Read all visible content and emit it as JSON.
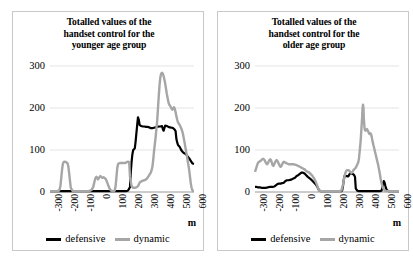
{
  "figure": {
    "unit_label": "m",
    "legend": [
      {
        "name": "defensive-series",
        "label": "defensive",
        "color": "#000000"
      },
      {
        "name": "dynamic-series",
        "label": "dynamic",
        "color": "#a6a6a6"
      }
    ]
  },
  "panels": [
    {
      "id": "younger",
      "title_lines": [
        "Totalled values of the",
        "handset control for the",
        "younger age group"
      ],
      "title_text": "Totalled values of the handset control for the younger age group"
    },
    {
      "id": "older",
      "title_lines": [
        "Totalled values of the",
        "handset control for the",
        "older age group"
      ],
      "title_text": "Totalled values of the handset control for the older age group"
    }
  ],
  "chart_data": [
    {
      "type": "line",
      "title": "Totalled values of the handset control for the younger age group",
      "xlabel": "m",
      "ylabel": "",
      "xlim": [
        -300,
        600
      ],
      "ylim": [
        0,
        300
      ],
      "xticks": [
        -300,
        -200,
        -100,
        0,
        100,
        200,
        300,
        400,
        500,
        600
      ],
      "yticks": [
        0,
        100,
        200,
        300
      ],
      "grid": true,
      "legend_position": "bottom",
      "series": [
        {
          "name": "defensive",
          "color": "#000000",
          "x": [
            -300,
            -280,
            -260,
            -240,
            -220,
            -200,
            -180,
            -160,
            -140,
            -120,
            -100,
            -80,
            -60,
            -40,
            -20,
            0,
            20,
            40,
            60,
            80,
            100,
            120,
            140,
            160,
            175,
            185,
            190,
            195,
            200,
            205,
            210,
            215,
            220,
            225,
            230,
            235,
            240,
            245,
            250,
            255,
            260,
            270,
            280,
            290,
            300,
            310,
            320,
            330,
            340,
            350,
            360,
            370,
            380,
            390,
            400,
            405,
            410,
            415,
            420,
            430,
            440,
            450,
            460,
            465,
            470,
            475,
            480,
            485,
            490,
            495,
            500,
            510,
            520,
            530,
            540,
            550,
            560,
            570,
            580,
            590,
            600
          ],
          "y": [
            2,
            2,
            2,
            2,
            2,
            2,
            2,
            2,
            2,
            2,
            2,
            2,
            2,
            2,
            2,
            2,
            2,
            2,
            2,
            2,
            2,
            2,
            2,
            2,
            2,
            3,
            5,
            8,
            12,
            48,
            72,
            90,
            100,
            102,
            104,
            120,
            140,
            160,
            178,
            172,
            160,
            157,
            156,
            156,
            155,
            155,
            154,
            152,
            152,
            153,
            154,
            155,
            156,
            156,
            157,
            150,
            146,
            152,
            158,
            157,
            155,
            154,
            153,
            153,
            152,
            150,
            148,
            145,
            126,
            118,
            112,
            108,
            100,
            95,
            92,
            90,
            85,
            80,
            74,
            68,
            67
          ]
        },
        {
          "name": "dynamic",
          "color": "#a6a6a6",
          "x": [
            -300,
            -285,
            -270,
            -255,
            -245,
            -240,
            -235,
            -230,
            -225,
            -220,
            -215,
            -210,
            -205,
            -200,
            -195,
            -190,
            -185,
            -180,
            -175,
            -170,
            -160,
            -150,
            -140,
            -130,
            -120,
            -110,
            -100,
            -90,
            -80,
            -70,
            -60,
            -50,
            -40,
            -30,
            -25,
            -20,
            -15,
            -10,
            -5,
            0,
            5,
            10,
            15,
            20,
            25,
            30,
            35,
            40,
            50,
            60,
            70,
            80,
            90,
            100,
            105,
            110,
            115,
            120,
            125,
            130,
            140,
            150,
            160,
            170,
            175,
            180,
            185,
            190,
            195,
            200,
            210,
            220,
            230,
            240,
            250,
            255,
            260,
            265,
            270,
            280,
            290,
            300,
            310,
            320,
            330,
            335,
            340,
            345,
            350,
            360,
            370,
            375,
            380,
            385,
            390,
            395,
            400,
            405,
            410,
            415,
            420,
            425,
            430,
            440,
            445,
            450,
            455,
            460,
            465,
            470,
            475,
            480,
            485,
            490,
            495,
            500,
            510,
            520,
            530,
            540,
            550,
            560,
            570,
            575,
            580,
            585,
            590,
            595,
            600
          ],
          "y": [
            2,
            2,
            2,
            2,
            3,
            6,
            14,
            32,
            52,
            66,
            71,
            72,
            72,
            71,
            70,
            68,
            60,
            44,
            26,
            10,
            3,
            2,
            2,
            2,
            2,
            2,
            2,
            2,
            2,
            2,
            2,
            3,
            5,
            12,
            20,
            28,
            34,
            36,
            34,
            30,
            33,
            36,
            38,
            36,
            34,
            34,
            35,
            34,
            30,
            20,
            10,
            4,
            2,
            2,
            4,
            14,
            34,
            56,
            66,
            68,
            69,
            69,
            69,
            69,
            70,
            71,
            72,
            72,
            71,
            36,
            14,
            10,
            10,
            11,
            14,
            18,
            22,
            24,
            25,
            27,
            28,
            30,
            34,
            40,
            46,
            52,
            60,
            76,
            96,
            130,
            170,
            200,
            230,
            256,
            274,
            282,
            284,
            282,
            276,
            268,
            258,
            246,
            234,
            214,
            208,
            206,
            202,
            198,
            196,
            200,
            202,
            198,
            190,
            180,
            172,
            166,
            160,
            152,
            140,
            120,
            98,
            76,
            52,
            36,
            20,
            10,
            4,
            2,
            2
          ]
        }
      ]
    },
    {
      "type": "line",
      "title": "Totalled values of the handset control for the older age group",
      "xlabel": "m",
      "ylabel": "",
      "xlim": [
        -300,
        600
      ],
      "ylim": [
        0,
        300
      ],
      "xticks": [
        -300,
        -200,
        -100,
        0,
        100,
        200,
        300,
        400,
        500,
        600
      ],
      "yticks": [
        0,
        100,
        200,
        300
      ],
      "grid": true,
      "legend_position": "bottom",
      "series": [
        {
          "name": "defensive",
          "color": "#000000",
          "x": [
            -300,
            -290,
            -280,
            -270,
            -260,
            -250,
            -240,
            -230,
            -220,
            -210,
            -200,
            -190,
            -180,
            -170,
            -160,
            -150,
            -140,
            -130,
            -120,
            -110,
            -100,
            -90,
            -80,
            -70,
            -60,
            -50,
            -40,
            -30,
            -20,
            -10,
            0,
            10,
            20,
            30,
            40,
            50,
            60,
            70,
            80,
            90,
            100,
            110,
            120,
            130,
            140,
            200,
            240,
            245,
            250,
            255,
            260,
            265,
            270,
            275,
            280,
            285,
            290,
            295,
            300,
            305,
            310,
            315,
            320,
            325,
            330,
            340,
            350,
            360,
            380,
            400,
            420,
            440,
            460,
            480,
            490,
            495,
            500,
            505,
            510,
            515,
            520,
            525,
            530,
            535,
            540,
            560,
            580,
            600
          ],
          "y": [
            12,
            12,
            11,
            11,
            10,
            10,
            10,
            10,
            11,
            12,
            12,
            12,
            13,
            16,
            19,
            20,
            20,
            21,
            22,
            26,
            28,
            28,
            29,
            30,
            32,
            34,
            38,
            40,
            43,
            46,
            46,
            44,
            40,
            36,
            33,
            30,
            26,
            22,
            18,
            12,
            4,
            2,
            2,
            2,
            2,
            2,
            2,
            4,
            14,
            30,
            38,
            39,
            38,
            38,
            37,
            38,
            42,
            44,
            44,
            44,
            43,
            42,
            40,
            36,
            8,
            3,
            2,
            2,
            2,
            2,
            2,
            2,
            2,
            2,
            3,
            8,
            18,
            26,
            22,
            14,
            8,
            4,
            3,
            2,
            2,
            2,
            2,
            2
          ]
        },
        {
          "name": "dynamic",
          "color": "#a6a6a6",
          "x": [
            -300,
            -295,
            -290,
            -285,
            -280,
            -275,
            -270,
            -265,
            -260,
            -255,
            -250,
            -245,
            -240,
            -235,
            -230,
            -225,
            -220,
            -215,
            -210,
            -205,
            -200,
            -195,
            -190,
            -185,
            -180,
            -175,
            -170,
            -165,
            -160,
            -155,
            -150,
            -145,
            -140,
            -135,
            -130,
            -125,
            -120,
            -110,
            -100,
            -90,
            -80,
            -70,
            -60,
            -50,
            -40,
            -30,
            -20,
            -10,
            0,
            10,
            20,
            30,
            40,
            50,
            60,
            70,
            80,
            90,
            100,
            110,
            120,
            130,
            200,
            230,
            240,
            245,
            250,
            255,
            260,
            265,
            270,
            275,
            280,
            285,
            290,
            295,
            300,
            305,
            310,
            315,
            320,
            325,
            330,
            335,
            340,
            345,
            350,
            355,
            360,
            365,
            370,
            372,
            375,
            378,
            380,
            385,
            390,
            395,
            400,
            405,
            410,
            415,
            420,
            425,
            430,
            435,
            440,
            445,
            450,
            455,
            460,
            465,
            470,
            475,
            480,
            485,
            490,
            500,
            510,
            520,
            530,
            540,
            560,
            580,
            600
          ],
          "y": [
            48,
            54,
            60,
            66,
            70,
            72,
            73,
            74,
            76,
            78,
            79,
            78,
            76,
            72,
            68,
            66,
            68,
            72,
            76,
            78,
            76,
            70,
            64,
            62,
            66,
            70,
            74,
            76,
            74,
            70,
            66,
            62,
            60,
            62,
            66,
            70,
            72,
            70,
            68,
            66,
            66,
            66,
            66,
            65,
            64,
            62,
            60,
            58,
            56,
            54,
            50,
            48,
            46,
            42,
            38,
            32,
            24,
            14,
            4,
            2,
            2,
            2,
            2,
            2,
            4,
            10,
            18,
            28,
            38,
            46,
            50,
            52,
            52,
            52,
            50,
            48,
            46,
            46,
            48,
            52,
            54,
            56,
            58,
            62,
            66,
            70,
            80,
            100,
            120,
            150,
            180,
            198,
            208,
            200,
            176,
            150,
            146,
            148,
            150,
            146,
            142,
            138,
            140,
            138,
            130,
            120,
            112,
            104,
            96,
            88,
            80,
            72,
            64,
            54,
            44,
            32,
            22,
            10,
            4,
            2,
            2,
            2,
            2,
            2,
            2
          ]
        }
      ]
    }
  ]
}
